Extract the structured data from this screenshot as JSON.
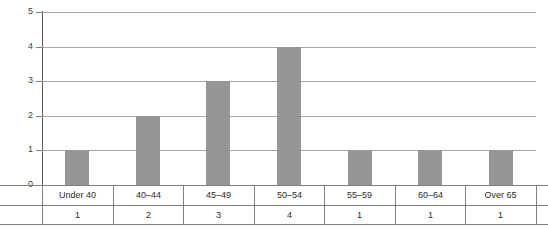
{
  "chart_data": {
    "type": "bar",
    "title": "",
    "subtitle": "",
    "xlabel": "",
    "ylabel": "",
    "categories": [
      "Under 40",
      "40–44",
      "45–49",
      "50–54",
      "55–59",
      "60–64",
      "Over 65"
    ],
    "values": [
      1,
      2,
      3,
      4,
      1,
      1,
      1
    ],
    "value_labels": [
      "1",
      "2",
      "3",
      "4",
      "1",
      "1",
      "1"
    ],
    "ylim": [
      0,
      5
    ],
    "ytick_labels": [
      "0",
      "1",
      "2",
      "3",
      "4",
      "5"
    ],
    "ytick_values": [
      0,
      1,
      2,
      3,
      4,
      5
    ],
    "grid": true,
    "grid_axis": "y",
    "legend": false,
    "legend_position": "none",
    "bar_color": "#969696",
    "grid_color": "#a6a6a6",
    "axis_color": "#595959",
    "table_line_color": "#808080",
    "data_table_below": true
  }
}
